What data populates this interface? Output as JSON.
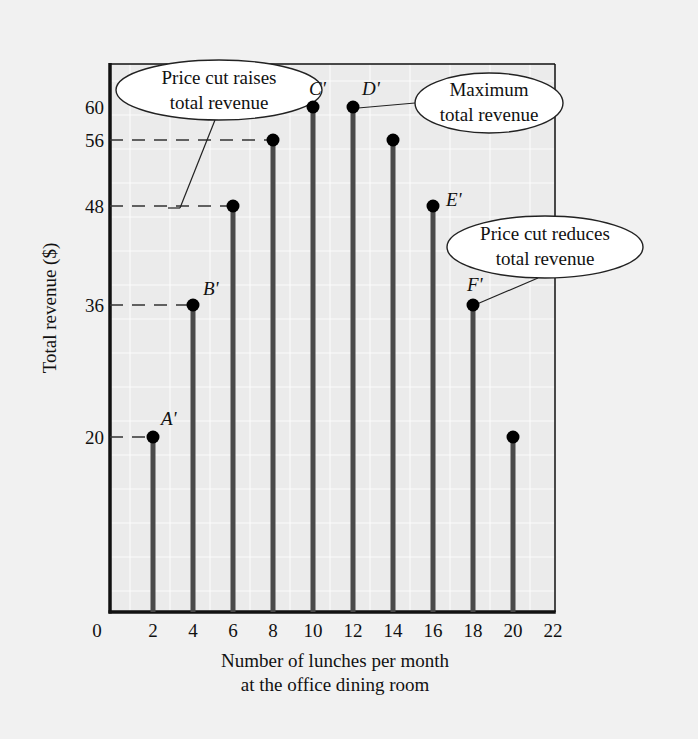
{
  "chart_data": {
    "type": "bar",
    "subtype": "stem",
    "title": "",
    "xlabel": "Number of lunches per month at the office dining room",
    "xlabel_lines": [
      "Number of lunches per month",
      "at the office dining room"
    ],
    "ylabel": "Total revenue ($)",
    "xlim": [
      0,
      22
    ],
    "x_ticks": [
      0,
      2,
      4,
      6,
      8,
      10,
      12,
      14,
      16,
      18,
      20,
      22
    ],
    "y_ticks": [
      20,
      36,
      48,
      56,
      60
    ],
    "grid": true,
    "legend": null,
    "x": [
      2,
      4,
      6,
      8,
      10,
      12,
      14,
      16,
      18,
      20
    ],
    "values": [
      20,
      36,
      48,
      56,
      60,
      60,
      56,
      48,
      36,
      20
    ],
    "point_labels": [
      {
        "x": 2,
        "y": 20,
        "label": "A'"
      },
      {
        "x": 4,
        "y": 36,
        "label": "B'"
      },
      {
        "x": 10,
        "y": 60,
        "label": "C'"
      },
      {
        "x": 12,
        "y": 60,
        "label": "D'"
      },
      {
        "x": 16,
        "y": 48,
        "label": "E'"
      },
      {
        "x": 18,
        "y": 36,
        "label": "F'"
      }
    ],
    "reference_lines": [
      {
        "y": 20,
        "to_x": 2,
        "style": "dashed"
      },
      {
        "y": 36,
        "to_x": 4,
        "style": "dashed"
      },
      {
        "y": 48,
        "to_x": 6,
        "style": "dashed"
      },
      {
        "y": 56,
        "to_x": 8,
        "style": "dashed"
      }
    ],
    "annotations": [
      {
        "text_lines": [
          "Price cut raises",
          "total revenue"
        ],
        "points_to": "dashed lines at 48 and 56"
      },
      {
        "text_lines": [
          "Maximum",
          "total revenue"
        ],
        "points_to": "D' (12, 60)"
      },
      {
        "text_lines": [
          "Price cut reduces",
          "total revenue"
        ],
        "points_to": "F' (18, 36)"
      }
    ]
  },
  "colors": {
    "background": "#f1f1f1",
    "plot_background": "#ebebeb",
    "grid": "#ffffff",
    "axis": "#111111",
    "stem": "#4a4a4a",
    "dot": "#000000",
    "callout_fill": "#ffffff"
  }
}
